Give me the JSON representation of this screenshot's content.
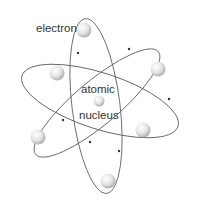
{
  "diagram": {
    "labels": {
      "electron": "electron",
      "nucleus_line1": "atomic",
      "nucleus_line2": "nucleus"
    },
    "colors": {
      "orbit": "#666666",
      "electron_fill": "#e6e6e6",
      "background": "#ffffff",
      "text": "#333333"
    },
    "electron_count": 6,
    "orbit_count": 3
  }
}
